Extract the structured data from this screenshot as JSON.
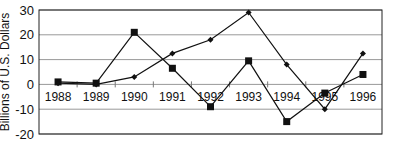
{
  "chart_data": {
    "type": "line",
    "title": "",
    "xlabel": "",
    "ylabel": "Billions of U.S. Dollars",
    "categories": [
      "1988",
      "1989",
      "1990",
      "1991",
      "1992",
      "1993",
      "1994",
      "1995",
      "1996"
    ],
    "ylim": [
      -20,
      30
    ],
    "yticks": [
      30,
      20,
      10,
      0,
      -10,
      -20
    ],
    "grid": true,
    "legend": "none",
    "series": [
      {
        "name": "Series A (square markers)",
        "marker": "square",
        "values": [
          1,
          0.5,
          21,
          6.5,
          -9,
          9.5,
          -15,
          -3.5,
          4
        ]
      },
      {
        "name": "Series B (diamond markers)",
        "marker": "diamond",
        "values": [
          0.5,
          0,
          3,
          12.5,
          18,
          29,
          8,
          -10,
          12.5
        ]
      }
    ]
  },
  "colors": {
    "line": "#111111",
    "grid": "#999999",
    "axis": "#222222"
  }
}
